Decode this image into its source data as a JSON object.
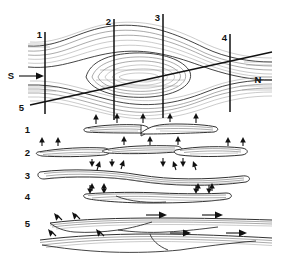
{
  "figure": {
    "type": "geological-block-diagram",
    "colors": {
      "ink": "#111111",
      "thin_line": "#555555",
      "faint_line": "#8a8a8a",
      "background": "#ffffff"
    }
  },
  "block_diagram": {
    "name": "map-view-block",
    "section_lines": [
      {
        "id": "section-line-1",
        "label": "1",
        "x": 45,
        "y_top": 32,
        "y_bottom": 114,
        "label_x": 42,
        "label_y": 38
      },
      {
        "id": "section-line-2",
        "label": "2",
        "x": 114,
        "y_top": 19,
        "y_bottom": 120,
        "label_x": 111,
        "label_y": 25
      },
      {
        "id": "section-line-3",
        "label": "3",
        "x": 163,
        "y_top": 14,
        "y_bottom": 118,
        "label_x": 160,
        "label_y": 21
      },
      {
        "id": "section-line-4",
        "label": "4",
        "x": 230,
        "y_top": 34,
        "y_bottom": 112,
        "label_x": 227,
        "label_y": 41
      }
    ],
    "diagonal_section": {
      "id": "section-line-5",
      "label": "5",
      "label_x": 24,
      "label_y": 111,
      "x1": 30,
      "y1": 105,
      "x2": 272,
      "y2": 52
    },
    "direction_markers": [
      {
        "id": "direction-south",
        "label": "S",
        "x": 11,
        "y": 76,
        "arrow": "right"
      },
      {
        "id": "direction-north",
        "label": "N",
        "x": 258,
        "y": 80,
        "arrow": "none"
      }
    ]
  },
  "sections": [
    {
      "id": "section-row-1",
      "label": "1",
      "label_x": 26,
      "label_y": 133,
      "baseline_y": 130,
      "description": "narrow lens with central notch, arrows above"
    },
    {
      "id": "section-row-2",
      "label": "2",
      "label_x": 26,
      "label_y": 156,
      "baseline_y": 153,
      "description": "wide layer with offsets, arrows above and below"
    },
    {
      "id": "section-row-3",
      "label": "3",
      "label_x": 26,
      "label_y": 179,
      "baseline_y": 176,
      "description": "broad wavy layer, arrows above and below"
    },
    {
      "id": "section-row-4",
      "label": "4",
      "label_x": 26,
      "label_y": 200,
      "baseline_y": 197,
      "description": "short flat lens, arrows at both ends"
    },
    {
      "id": "section-row-5",
      "label": "5",
      "label_x": 26,
      "label_y": 227,
      "baseline_y": 222,
      "description": "two stacked thrust sheets with right-directed transport arrows"
    }
  ]
}
